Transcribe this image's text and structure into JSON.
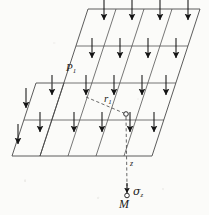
{
  "figure": {
    "caption_labels": {
      "load_point": {
        "symbol": "P",
        "subscript": "1"
      },
      "radial_distance": {
        "symbol": "r",
        "subscript": "1"
      },
      "depth_axis": "z",
      "stress": "σ",
      "stress_subscript": "z",
      "evaluation_point": "M"
    },
    "colors": {
      "line": "#4a4a4a",
      "arrow": "#1a1a1a",
      "dashed": "#555555",
      "background": "#fbfbf9",
      "text": "#1b1b1b"
    },
    "geometry": {
      "description": "inclined rectangular loaded area drawn in oblique projection, subdivided into a 4-by-4 grid of cells, each cell carrying one downward load arrow",
      "grid_rows": 4,
      "grid_cols": 4,
      "arrow_count": 16,
      "surface_outline": [
        [
          88,
          9
        ],
        [
          200,
          9
        ],
        [
          152,
          156
        ],
        [
          40,
          156
        ]
      ],
      "row_lines_y": [
        9,
        46,
        83,
        120,
        156
      ],
      "skew_dx_per_row": -12,
      "col_fractions": [
        0,
        0.25,
        0.5,
        0.75,
        1
      ],
      "point_on_surface": [
        126,
        114
      ],
      "point_M": [
        127,
        196
      ],
      "depth_line": [
        [
          126,
          114
        ],
        [
          127,
          190
        ]
      ],
      "radial_line": [
        [
          86,
          97
        ],
        [
          126,
          114
        ]
      ]
    },
    "arrows": {
      "shaft_length": 22,
      "head_length": 7,
      "head_width": 5
    }
  }
}
